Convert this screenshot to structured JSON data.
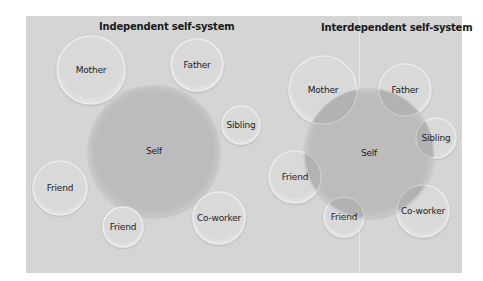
{
  "colors": {
    "background": "#ffffff",
    "panel": "#d5d5d5",
    "other_fill": "#d9d9d9",
    "other_rim": "#ececec",
    "self_fill": "#bcbcbc",
    "overlap_fill": "#b2b2b2",
    "text": "#222222"
  },
  "independent": {
    "title": "Independent self-system",
    "self": {
      "label": "Self",
      "cx": 154,
      "cy": 151,
      "r": 65
    },
    "others": [
      {
        "label": "Mother",
        "cx": 91,
        "cy": 70,
        "r": 34
      },
      {
        "label": "Father",
        "cx": 197,
        "cy": 65,
        "r": 26
      },
      {
        "label": "Sibling",
        "cx": 241,
        "cy": 125,
        "r": 19
      },
      {
        "label": "Friend",
        "cx": 60,
        "cy": 188,
        "r": 27
      },
      {
        "label": "Friend",
        "cx": 123,
        "cy": 227,
        "r": 20
      },
      {
        "label": "Co-worker",
        "cx": 219,
        "cy": 218,
        "r": 26
      }
    ]
  },
  "interdependent": {
    "title": "Interdependent self-system",
    "self": {
      "label": "Self",
      "cx": 369,
      "cy": 153,
      "r": 64
    },
    "others": [
      {
        "label": "Mother",
        "cx": 323,
        "cy": 90,
        "r": 34
      },
      {
        "label": "Father",
        "cx": 405,
        "cy": 90,
        "r": 26
      },
      {
        "label": "Sibling",
        "cx": 436,
        "cy": 138,
        "r": 20
      },
      {
        "label": "Friend",
        "cx": 295,
        "cy": 177,
        "r": 26
      },
      {
        "label": "Friend",
        "cx": 344,
        "cy": 217,
        "r": 20
      },
      {
        "label": "Co-worker",
        "cx": 423,
        "cy": 211,
        "r": 26
      }
    ]
  }
}
